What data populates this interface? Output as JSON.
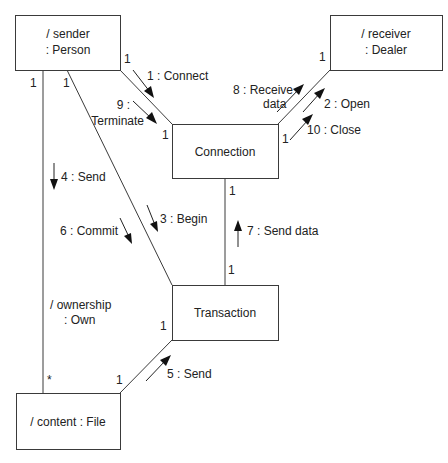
{
  "diagram": {
    "type": "UML collaboration diagram",
    "objects": {
      "sender": {
        "line1": "/ sender",
        "line2": ": Person"
      },
      "receiver": {
        "line1": "/ receiver",
        "line2": ": Dealer"
      },
      "connection": {
        "label": "Connection"
      },
      "transaction": {
        "label": "Transaction"
      },
      "content": {
        "label": "/ content : File"
      }
    },
    "associations": {
      "ownership": {
        "line1": "/ ownership",
        "line2": ": Own"
      }
    },
    "multiplicities": {
      "sender_connection": "1",
      "connection_sender": "1",
      "connection_receiver": "1",
      "receiver_connection": "1",
      "sender_own": "1",
      "sender_transaction": "1",
      "connection_transaction": "1",
      "transaction_connection": "1",
      "transaction_content": "1",
      "content_transaction": "1",
      "content_own": "*"
    },
    "messages": {
      "m1": "1 : Connect",
      "m2": "2 : Open",
      "m3": "3 : Begin",
      "m4": "4 : Send",
      "m5": "5 : Send",
      "m6": "6 : Commit",
      "m7": "7 : Send data",
      "m8_line1": "8 : Receive",
      "m8_line2": "data",
      "m9_line1": "9 :",
      "m9_line2": "Terminate",
      "m10": "10 : Close"
    }
  }
}
